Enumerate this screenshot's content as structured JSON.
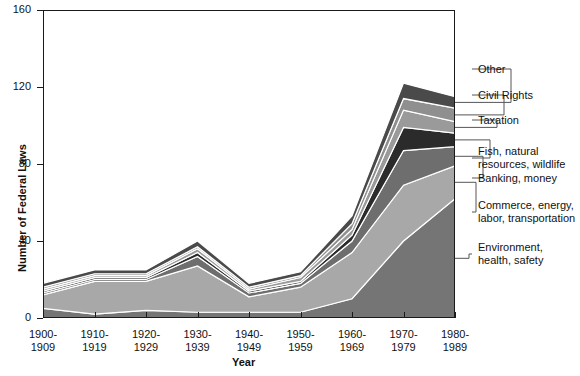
{
  "chart_data": {
    "type": "area",
    "title": "",
    "xlabel": "Year",
    "ylabel": "Number of Federal Laws",
    "ylim": [
      0,
      160
    ],
    "yticks": [
      0,
      40,
      80,
      120,
      160
    ],
    "grid": false,
    "legend_position": "right-leader-lines",
    "stacked": true,
    "categories": [
      "1900-1909",
      "1910-1919",
      "1920-1929",
      "1930-1939",
      "1940-1949",
      "1950-1959",
      "1960-1969",
      "1970-1979",
      "1980-1989"
    ],
    "category_lines": [
      [
        "1900-",
        "1909"
      ],
      [
        "1910-",
        "1919"
      ],
      [
        "1920-",
        "1929"
      ],
      [
        "1930-",
        "1939"
      ],
      [
        "1940-",
        "1949"
      ],
      [
        "1950-",
        "1959"
      ],
      [
        "1960-",
        "1969"
      ],
      [
        "1970-",
        "1979"
      ],
      [
        "1980-",
        "1989"
      ]
    ],
    "series": [
      {
        "name": "Environment, health, safety",
        "label_lines": [
          "Environment,",
          "health, safety"
        ],
        "color": "#757575",
        "values": [
          5,
          2,
          4,
          3,
          3,
          3,
          10,
          40,
          62
        ]
      },
      {
        "name": "Commerce, energy, labor, transportation",
        "label_lines": [
          "Commerce, energy,",
          "labor, transportation"
        ],
        "color": "#a8a8a8",
        "values": [
          7,
          17,
          15,
          24,
          8,
          13,
          24,
          29,
          17
        ]
      },
      {
        "name": "Banking, money",
        "label_lines": [
          "Banking, money"
        ],
        "color": "#6e6e6e",
        "values": [
          1,
          1,
          1,
          5,
          2,
          2,
          6,
          18,
          10
        ]
      },
      {
        "name": "Fish, natural resources, wildlife",
        "label_lines": [
          "Fish, natural",
          "resources, wildlife"
        ],
        "color": "#2b2b2b",
        "values": [
          1,
          1,
          1,
          2,
          1,
          1,
          3,
          12,
          7
        ]
      },
      {
        "name": "Taxation",
        "label_lines": [
          "Taxation"
        ],
        "color": "#9a9a9a",
        "values": [
          1,
          1,
          1,
          2,
          1,
          2,
          3,
          9,
          6
        ]
      },
      {
        "name": "Civil Rights",
        "label_lines": [
          "Civil Rights"
        ],
        "color": "#8f8f8f",
        "values": [
          1,
          1,
          1,
          1,
          1,
          1,
          3,
          6,
          7
        ]
      },
      {
        "name": "Other",
        "label_lines": [
          "Other"
        ],
        "color": "#4a4a4a",
        "values": [
          2,
          2,
          2,
          3,
          2,
          2,
          4,
          8,
          6
        ]
      }
    ],
    "totals": [
      18,
      25,
      25,
      40,
      18,
      24,
      53,
      122,
      115
    ]
  }
}
